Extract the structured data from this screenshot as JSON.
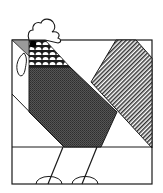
{
  "illustration": {
    "subject": "Rooster quilt block",
    "colors": {
      "background": "#ffffff",
      "outline": "#1a1a1a",
      "body_dark": "#4a4a4a",
      "tail_stripe": "#8a8a8a",
      "beak_gray": "#9a9a9a",
      "scales_fill": "#ffffff",
      "eye": "#000000"
    },
    "parts": [
      "comb",
      "beak",
      "eye",
      "wattle",
      "neck-scales",
      "body",
      "tail",
      "legs",
      "feet",
      "frame"
    ]
  }
}
